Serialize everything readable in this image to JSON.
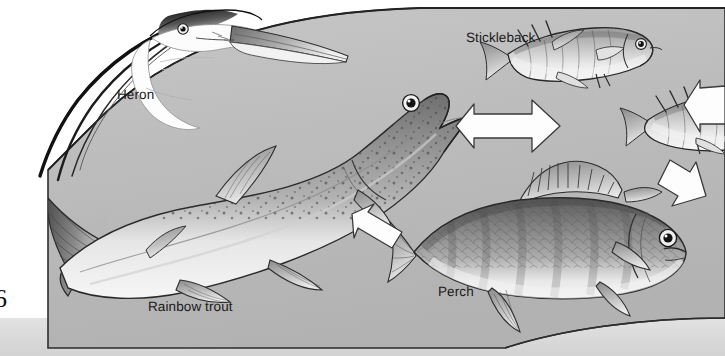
{
  "figure": {
    "kind": "food-chain-illustration",
    "page_number": "6",
    "background_color": "#ffffff",
    "water_panel_color": "#b9b9b9",
    "water_panel_outline": "#2b2b2b",
    "bottom_band_color": "#d8d8d8",
    "arrow_fill": "#fdfdfd",
    "arrow_outline": "#333333",
    "label_color": "#1a1a1a"
  },
  "labels": {
    "heron": "Heron",
    "stickleback": "Stickleback",
    "rainbow_trout": "Rainbow trout",
    "perch": "Perch"
  },
  "organisms": [
    {
      "name": "Heron",
      "label": "Heron",
      "icon": "heron-head-icon",
      "trophic_level": 4
    },
    {
      "name": "Rainbow trout",
      "label": "Rainbow trout",
      "icon": "rainbow-trout-icon",
      "trophic_level": 3
    },
    {
      "name": "Perch",
      "label": "Perch",
      "icon": "perch-icon",
      "trophic_level": 2
    },
    {
      "name": "Stickleback",
      "label": "Stickleback",
      "icon": "stickleback-icon",
      "trophic_level": 1,
      "count": 2
    }
  ],
  "arrows": [
    {
      "id": "arrow-stickleback-to-trout",
      "direction": "left",
      "from": "Stickleback",
      "to": "Rainbow trout"
    },
    {
      "id": "arrow-perch-to-trout",
      "direction": "up-left",
      "from": "Perch",
      "to": "Rainbow trout"
    },
    {
      "id": "arrow-stickleback-to-perch",
      "direction": "down",
      "from": "Stickleback",
      "to": "Perch"
    },
    {
      "id": "arrow-offscreen-to-stickleback",
      "direction": "left",
      "from": "off-screen",
      "to": "Stickleback"
    }
  ]
}
